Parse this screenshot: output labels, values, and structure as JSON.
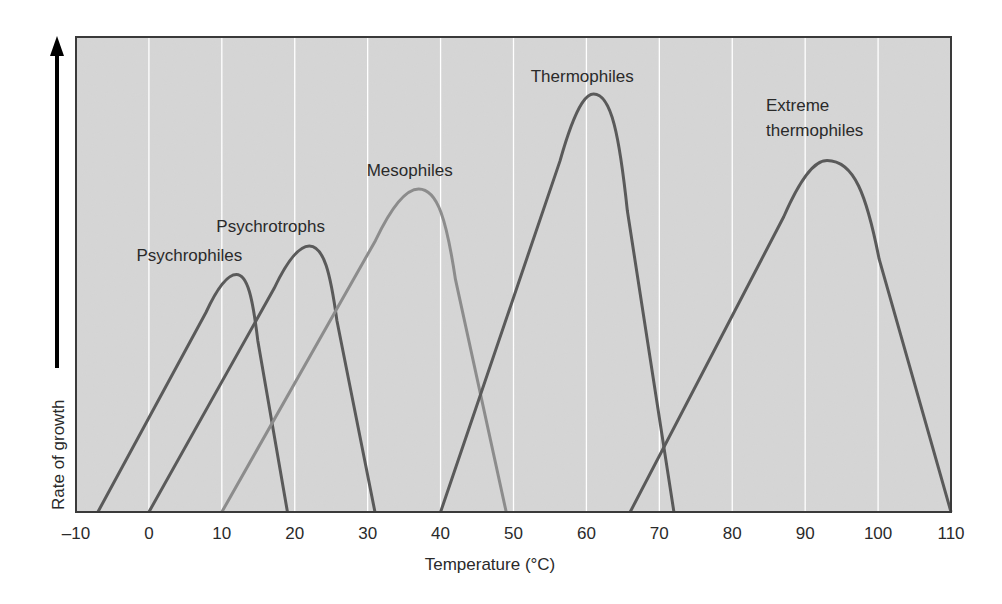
{
  "chart_data": {
    "type": "line",
    "title": "",
    "xlabel": "Temperature (°C)",
    "ylabel": "Rate of growth",
    "xlim": [
      -10,
      110
    ],
    "xticks": [
      -10,
      0,
      10,
      20,
      30,
      40,
      50,
      60,
      70,
      80,
      90,
      100,
      110
    ],
    "xtick_labels": [
      "–10",
      "0",
      "10",
      "20",
      "30",
      "40",
      "50",
      "60",
      "70",
      "80",
      "90",
      "100",
      "110"
    ],
    "ylim": [
      0,
      1
    ],
    "y_ticks_shown": false,
    "grid": {
      "vertical": true,
      "horizontal": false,
      "color": "#ffffff"
    },
    "legend": "none (curves labeled directly)",
    "colors": {
      "plot_background": "#d6d6d6",
      "frame": "#3a3a3a",
      "dark_curve": "#5a5a5a",
      "light_curve": "#8c8c8c"
    },
    "series": [
      {
        "name": "Psychrophiles",
        "label": "Psychrophiles",
        "min_temp": -7,
        "optimum_temp": 12,
        "max_temp": 19,
        "relative_peak": 0.5,
        "color": "#5a5a5a"
      },
      {
        "name": "Psychrotrophs",
        "label": "Psychrotrophs",
        "min_temp": 0,
        "optimum_temp": 22,
        "max_temp": 31,
        "relative_peak": 0.56,
        "color": "#5a5a5a"
      },
      {
        "name": "Mesophiles",
        "label": "Mesophiles",
        "min_temp": 10,
        "optimum_temp": 37,
        "max_temp": 49,
        "relative_peak": 0.68,
        "color": "#8c8c8c"
      },
      {
        "name": "Thermophiles",
        "label": "Thermophiles",
        "min_temp": 40,
        "optimum_temp": 61,
        "max_temp": 72,
        "relative_peak": 0.88,
        "color": "#5a5a5a"
      },
      {
        "name": "Extreme thermophiles",
        "label_lines": [
          "Extreme",
          "thermophiles"
        ],
        "min_temp": 66,
        "optimum_temp": 93,
        "max_temp": 110,
        "relative_peak": 0.74,
        "color": "#5a5a5a"
      }
    ]
  }
}
